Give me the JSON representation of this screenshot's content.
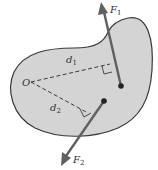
{
  "diagram": {
    "type": "torque-moment-arms",
    "colors": {
      "body_fill": "#d4d4d4",
      "body_stroke": "#3a3a3a",
      "force": "#606060",
      "dashed": "#3a3a3a",
      "background": "#ffffff"
    },
    "origin": {
      "label": "O"
    },
    "forces": [
      {
        "name": "F",
        "sub": "1"
      },
      {
        "name": "F",
        "sub": "2"
      }
    ],
    "distances": [
      {
        "name": "d",
        "sub": "1"
      },
      {
        "name": "d",
        "sub": "2"
      }
    ]
  }
}
